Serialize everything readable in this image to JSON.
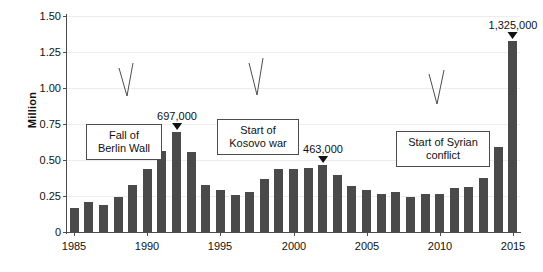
{
  "chart_data": {
    "type": "bar",
    "title": "",
    "xlabel": "",
    "ylabel": "Million",
    "ylim": [
      0,
      1.5
    ],
    "ytick_values": [
      0,
      0.25,
      0.5,
      0.75,
      1.0,
      1.25,
      1.5
    ],
    "ytick_labels": [
      "0",
      "0.25",
      "0.50",
      "0.75",
      "1.00",
      "1.25",
      "1.50"
    ],
    "xtick_labels": [
      "1985",
      "1990",
      "1995",
      "2000",
      "2005",
      "2010",
      "2015"
    ],
    "grid": true,
    "legend": "none",
    "bar_color": "#4a4a4a",
    "categories": [
      "1985",
      "1986",
      "1987",
      "1988",
      "1989",
      "1990",
      "1991",
      "1992",
      "1993",
      "1994",
      "1995",
      "1996",
      "1997",
      "1998",
      "1999",
      "2000",
      "2001",
      "2002",
      "2003",
      "2004",
      "2005",
      "2006",
      "2007",
      "2008",
      "2009",
      "2010",
      "2011",
      "2012",
      "2013",
      "2014",
      "2015"
    ],
    "values": [
      0.17,
      0.21,
      0.19,
      0.245,
      0.325,
      0.44,
      0.56,
      0.697,
      0.555,
      0.325,
      0.29,
      0.26,
      0.28,
      0.365,
      0.44,
      0.435,
      0.445,
      0.463,
      0.395,
      0.32,
      0.29,
      0.265,
      0.275,
      0.24,
      0.265,
      0.265,
      0.305,
      0.315,
      0.375,
      0.59,
      1.325
    ],
    "value_annotations": [
      {
        "category": "1992",
        "label": "697,000",
        "value": 0.697
      },
      {
        "category": "2002",
        "label": "463,000",
        "value": 0.463
      },
      {
        "category": "2015",
        "label": "1,325,000",
        "value": 1.325
      }
    ],
    "callouts": [
      {
        "id": "berlin-wall",
        "lines": [
          "Fall of",
          "Berlin Wall"
        ],
        "target_category": "1989"
      },
      {
        "id": "kosovo-war",
        "lines": [
          "Start of",
          "Kosovo war"
        ],
        "target_category": "1998"
      },
      {
        "id": "syrian-conflict",
        "lines": [
          "Start of Syrian",
          "conflict"
        ],
        "target_category": "2011"
      }
    ]
  },
  "callout_text": {
    "berlin_wall_line1": "Fall of",
    "berlin_wall_line2": "Berlin Wall",
    "kosovo_line1": "Start of",
    "kosovo_line2": "Kosovo war",
    "syrian_line1": "Start of Syrian",
    "syrian_line2": "conflict"
  },
  "labels": {
    "value_1992": "697,000",
    "value_2002": "463,000",
    "value_2015": "1,325,000"
  }
}
